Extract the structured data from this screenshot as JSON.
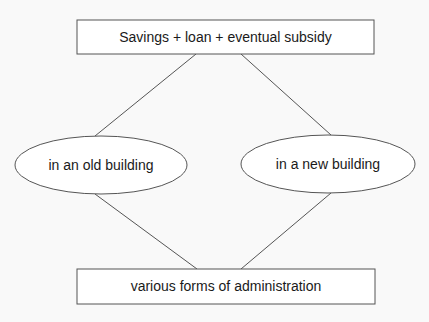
{
  "diagram": {
    "nodes": [
      {
        "id": "top",
        "shape": "rect",
        "label": "Savings + loan + eventual subsidy",
        "x": 77,
        "y": 20,
        "w": 297,
        "h": 34
      },
      {
        "id": "left",
        "shape": "ellipse",
        "label": "in an old building",
        "cx": 101,
        "cy": 165,
        "rx": 86,
        "ry": 29
      },
      {
        "id": "right",
        "shape": "ellipse",
        "label": "in a new building",
        "cx": 328,
        "cy": 164,
        "rx": 87,
        "ry": 29
      },
      {
        "id": "bottom",
        "shape": "rect",
        "label": "various forms of administration",
        "x": 77,
        "y": 269,
        "w": 298,
        "h": 35
      }
    ],
    "edges": [
      {
        "from": "top",
        "to": "left"
      },
      {
        "from": "top",
        "to": "right"
      },
      {
        "from": "left",
        "to": "bottom"
      },
      {
        "from": "right",
        "to": "bottom"
      }
    ],
    "colors": {
      "stroke": "#555555",
      "fill": "#ffffff",
      "background": "#f9f9f9",
      "text": "#1a1a1a"
    }
  }
}
